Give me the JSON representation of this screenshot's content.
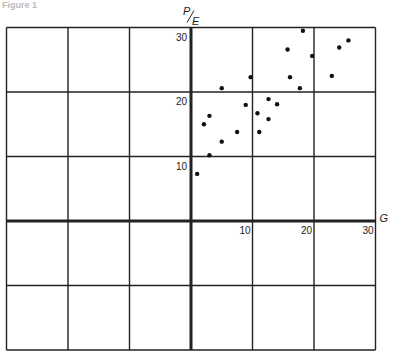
{
  "figure": {
    "title": "Figure 1"
  },
  "chart_data": {
    "type": "scatter",
    "title": "Figure 1",
    "xlabel": "G",
    "ylabel": "P/E",
    "xlim": [
      -30,
      30
    ],
    "ylim": [
      -20,
      30
    ],
    "grid": true,
    "x_ticks": [
      10,
      20,
      30
    ],
    "y_ticks": [
      10,
      20,
      30
    ],
    "points": [
      {
        "x": 5.0,
        "y": 20.6
      },
      {
        "x": 9.7,
        "y": 22.3
      },
      {
        "x": 18.2,
        "y": 29.5
      },
      {
        "x": 15.7,
        "y": 26.6
      },
      {
        "x": 19.7,
        "y": 25.6
      },
      {
        "x": 16.1,
        "y": 22.3
      },
      {
        "x": 17.7,
        "y": 20.6
      },
      {
        "x": 22.9,
        "y": 22.5
      },
      {
        "x": 24.1,
        "y": 26.9
      },
      {
        "x": 25.6,
        "y": 28.0
      },
      {
        "x": 8.9,
        "y": 18.0
      },
      {
        "x": 12.6,
        "y": 18.9
      },
      {
        "x": 14.0,
        "y": 18.1
      },
      {
        "x": 3.0,
        "y": 16.3
      },
      {
        "x": 2.1,
        "y": 15.0
      },
      {
        "x": 10.8,
        "y": 16.7
      },
      {
        "x": 12.6,
        "y": 15.8
      },
      {
        "x": 7.5,
        "y": 13.8
      },
      {
        "x": 11.1,
        "y": 13.8
      },
      {
        "x": 5.0,
        "y": 12.3
      },
      {
        "x": 3.0,
        "y": 10.2
      },
      {
        "x": 1.0,
        "y": 7.3
      }
    ]
  }
}
